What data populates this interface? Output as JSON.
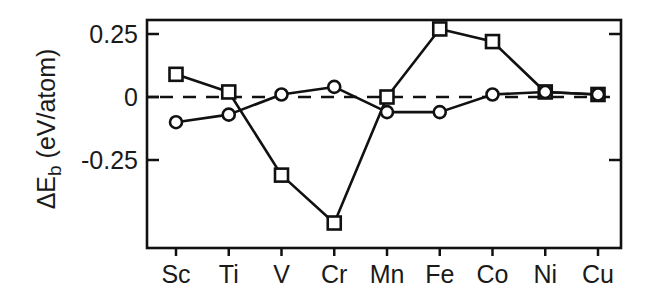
{
  "chart_data": {
    "type": "line",
    "title": "",
    "xlabel": "",
    "ylabel": "ΔE_b (eV/atom)",
    "ylabel_parts": {
      "prefix": "ΔE",
      "subscript": "b",
      "suffix": " (eV/atom)"
    },
    "categories": [
      "Sc",
      "Ti",
      "V",
      "Cr",
      "Mn",
      "Fe",
      "Co",
      "Ni",
      "Cu"
    ],
    "series": [
      {
        "name": "squares",
        "marker": "square",
        "values": [
          0.09,
          0.02,
          -0.31,
          -0.5,
          0.0,
          0.27,
          0.22,
          0.02,
          0.01
        ]
      },
      {
        "name": "circles",
        "marker": "circle",
        "values": [
          -0.1,
          -0.07,
          0.01,
          0.04,
          -0.06,
          -0.06,
          0.01,
          0.02,
          0.01
        ]
      }
    ],
    "yticks": [
      0.25,
      0,
      -0.25
    ],
    "ytick_labels": [
      "0.25",
      "0",
      "-0.25"
    ],
    "ylim": [
      -0.6,
      0.306
    ],
    "reference_line": {
      "y": 0,
      "style": "dashed"
    },
    "grid": false,
    "legend": null,
    "colors": {
      "line": "#111111",
      "marker_fill": "#ffffff",
      "text": "#1a1a1a"
    }
  }
}
